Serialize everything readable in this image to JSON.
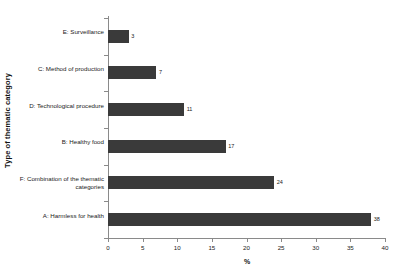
{
  "chart_data": {
    "type": "bar",
    "orientation": "horizontal",
    "title": "",
    "xlabel": "%",
    "ylabel": "Type of thematic category",
    "categories": [
      "E: Surveillance",
      "C: Method of production",
      "D: Technological procedure",
      "B: Healthy food",
      "F: Combination of the thematic categories",
      "A: Harmless for health"
    ],
    "values": [
      3,
      7,
      11,
      17,
      24,
      38
    ],
    "value_labels": [
      "3",
      "7",
      "11",
      "17",
      "24",
      "38"
    ],
    "xlim": [
      0,
      40
    ],
    "xticks": [
      0,
      5,
      10,
      15,
      20,
      25,
      30,
      35,
      40
    ],
    "xtick_labels": [
      "0",
      "5",
      "10",
      "15",
      "20",
      "25",
      "30",
      "35",
      "40"
    ],
    "grid": false,
    "legend": false,
    "bar_color": "#3a3a3a",
    "axis_color": "#8a8a8a",
    "background": "#ffffff"
  }
}
